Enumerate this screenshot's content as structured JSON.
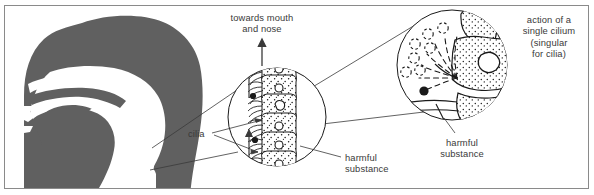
{
  "figure": {
    "title_visible": false,
    "background": "#ffffff",
    "border_color": "#8a8a8a",
    "silhouette_color": "#606060",
    "ink_color": "#1a1a1a",
    "text_color": "#3a3a3a"
  },
  "labels": {
    "towards_mouth_and_nose": "towards mouth\nand nose",
    "cilia": "cilia",
    "harmful_substance_middle": "harmful\nsubstance",
    "harmful_substance_large": "harmful\nsubstance",
    "action_of_single_cilium": "action of a\nsingle cilium\n(singular\nfor cilia)"
  },
  "panels": {
    "head": {
      "name": "head-and-neck-sagittal-silhouette",
      "features": [
        "nasal cavity",
        "hard palate",
        "tongue",
        "oral cavity",
        "pharynx",
        "trachea"
      ]
    },
    "epithelium_circle": {
      "name": "ciliated-epithelium-magnification",
      "cell_count": 7,
      "cilia_side": "left",
      "flow_arrows": 2,
      "flow_direction": "up",
      "harmful_particles": 3
    },
    "cilium_circle": {
      "name": "single-cilium-action-magnification",
      "motion_trace_positions": 7,
      "harmful_particles": 1,
      "cells_visible": 3
    }
  },
  "icons": {
    "up_arrow": "arrow-up-icon",
    "leader_line": "leader-line-icon"
  }
}
